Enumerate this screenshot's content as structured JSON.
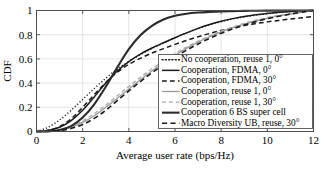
{
  "chart_data": {
    "type": "line",
    "title": "",
    "xlabel": "Average user rate (bps/Hz)",
    "ylabel": "CDF",
    "xlim": [
      0,
      12
    ],
    "ylim": [
      0,
      1
    ],
    "xticks": [
      0,
      2,
      4,
      6,
      8,
      10,
      12
    ],
    "xticklabels": [
      "0",
      "2",
      "4",
      "6",
      "8",
      "10",
      "12"
    ],
    "yticks": [
      0,
      0.2,
      0.4,
      0.6,
      0.8,
      1
    ],
    "yticklabels": [
      "0",
      "0.2",
      "0.4",
      "0.6",
      "0.8",
      "1"
    ],
    "grid": true,
    "legend_position": "center-right-inside",
    "x": [
      0,
      0.5,
      1,
      1.5,
      2,
      2.5,
      3,
      3.5,
      4,
      4.5,
      5,
      5.5,
      6,
      6.5,
      7,
      7.5,
      8,
      8.5,
      9,
      9.5,
      10,
      10.5,
      11,
      11.5,
      12
    ],
    "series": [
      {
        "name": "No cooperation, reuse 1, 0°",
        "style": "dotted",
        "color": "#222222",
        "width": 1.4,
        "values": [
          0.0,
          0.035,
          0.095,
          0.175,
          0.265,
          0.355,
          0.44,
          0.515,
          0.58,
          0.635,
          0.685,
          0.73,
          0.775,
          0.815,
          0.85,
          0.882,
          0.908,
          0.93,
          0.948,
          0.962,
          0.973,
          0.982,
          0.99,
          0.996,
          1.0
        ]
      },
      {
        "name": "Cooperation, FDMA, 0°",
        "style": "solid",
        "color": "#1a1a1a",
        "width": 1.5,
        "values": [
          0.0,
          0.008,
          0.035,
          0.09,
          0.175,
          0.285,
          0.4,
          0.5,
          0.578,
          0.64,
          0.69,
          0.733,
          0.775,
          0.815,
          0.852,
          0.884,
          0.911,
          0.933,
          0.951,
          0.965,
          0.976,
          0.985,
          0.992,
          0.997,
          1.0
        ]
      },
      {
        "name": "Cooperation, FDMA, 30°",
        "style": "dashed",
        "color": "#1a1a1a",
        "width": 1.5,
        "values": [
          0.0,
          0.01,
          0.04,
          0.105,
          0.2,
          0.305,
          0.405,
          0.49,
          0.555,
          0.605,
          0.648,
          0.685,
          0.72,
          0.752,
          0.783,
          0.81,
          0.835,
          0.857,
          0.876,
          0.892,
          0.906,
          0.918,
          0.93,
          0.94,
          0.95
        ]
      },
      {
        "name": "Cooperation, reuse 1, 0°",
        "style": "solid",
        "color": "#999999",
        "width": 1.3,
        "values": [
          0.0,
          0.002,
          0.012,
          0.035,
          0.075,
          0.13,
          0.2,
          0.275,
          0.352,
          0.428,
          0.5,
          0.568,
          0.63,
          0.687,
          0.738,
          0.783,
          0.823,
          0.858,
          0.888,
          0.914,
          0.936,
          0.955,
          0.971,
          0.986,
          1.0
        ]
      },
      {
        "name": "Cooperation, reuse 1, 30°",
        "style": "dashed",
        "color": "#aaaaaa",
        "width": 1.3,
        "values": [
          0.0,
          0.003,
          0.015,
          0.042,
          0.088,
          0.148,
          0.218,
          0.295,
          0.372,
          0.447,
          0.518,
          0.583,
          0.643,
          0.698,
          0.747,
          0.791,
          0.83,
          0.864,
          0.894,
          0.92,
          0.942,
          0.96,
          0.975,
          0.988,
          1.0
        ]
      },
      {
        "name": "Cooperation 6 BS super cell",
        "style": "solid",
        "color": "#2b2b2b",
        "width": 2.1,
        "values": [
          0.0,
          0.002,
          0.012,
          0.045,
          0.115,
          0.225,
          0.37,
          0.53,
          0.68,
          0.795,
          0.873,
          0.925,
          0.956,
          0.973,
          0.983,
          0.989,
          0.993,
          0.995,
          0.997,
          0.998,
          0.999,
          0.999,
          1.0,
          1.0,
          1.0
        ]
      },
      {
        "name": "Macro Diversity UB, reuse, 30°",
        "style": "dashed",
        "color": "#1a1a1a",
        "width": 1.6,
        "values": [
          0.0,
          0.001,
          0.008,
          0.025,
          0.058,
          0.108,
          0.175,
          0.255,
          0.335,
          0.412,
          0.485,
          0.552,
          0.615,
          0.672,
          0.723,
          0.77,
          0.812,
          0.848,
          0.88,
          0.908,
          0.932,
          0.952,
          0.97,
          0.986,
          1.0
        ]
      }
    ]
  }
}
